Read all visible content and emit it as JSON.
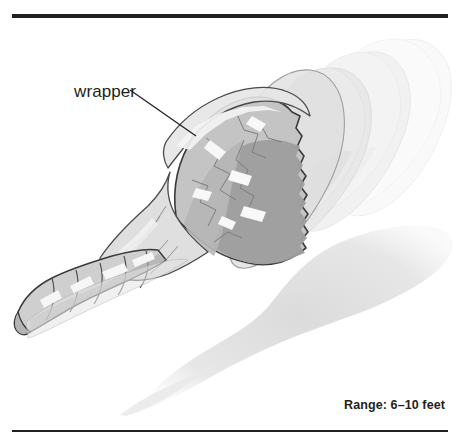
{
  "figure": {
    "type": "grayscale-line-illustration",
    "background_color": "#ffffff",
    "rules": {
      "top_color": "#231f20",
      "bottom_color": "#231f20"
    },
    "callout": {
      "label": "wrapper",
      "leader_line_color": "#231f20"
    },
    "caption": {
      "text": "Range: 6–10 feet"
    },
    "palette": {
      "outline": "#3a3a3a",
      "wrapper_film_light": "#e9e9e9",
      "wrapper_film_mid": "#d8d8d8",
      "candy_light": "#c9c9c9",
      "candy_mid": "#b4b4b4",
      "candy_dark": "#9a9a9a",
      "highlight": "#f6f6f6",
      "shadow": "#e2e2e2",
      "trail_near": "#ededed",
      "trail_far": "#f7f7f7"
    }
  }
}
